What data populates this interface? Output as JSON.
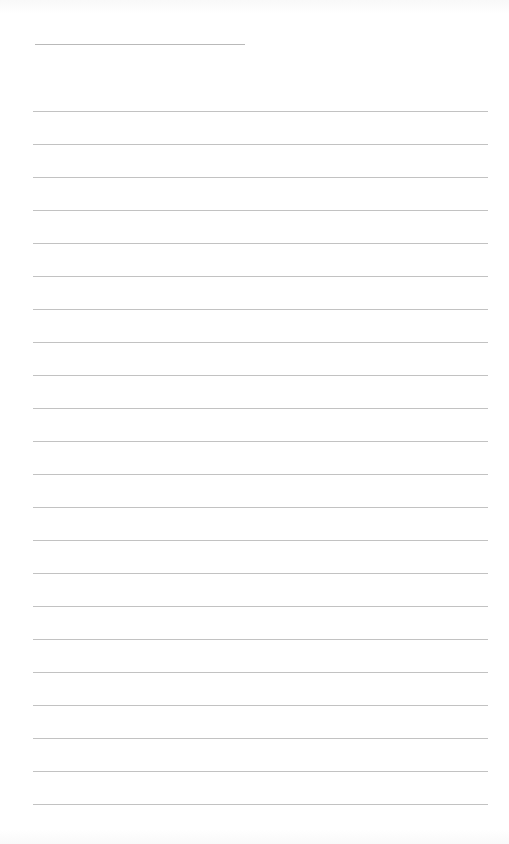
{
  "page": {
    "type": "lined-paper",
    "background": "#ffffff",
    "line_color": "#c2c2c2",
    "title_line": {
      "x": 35,
      "y": 44,
      "width": 210
    },
    "rules": {
      "count": 22,
      "x": 33,
      "width": 455,
      "first_y": 111,
      "spacing": 33
    }
  }
}
